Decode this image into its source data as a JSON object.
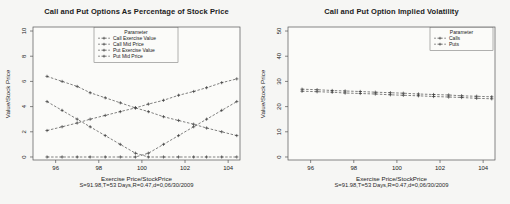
{
  "page": {
    "background": "#f6f6f4",
    "ink_color": "#4a4a4a"
  },
  "chart_data": [
    {
      "type": "line",
      "title": "Call and Put Options As Percentage of Stock Price",
      "xlabel": "Exercise Price/StockPrice",
      "xlabel_sub": "S=91.98,T=53 Days,R=0.47,d=0,06/30/2009",
      "ylabel": "Value/Stock Price",
      "xlim": [
        94.95,
        104.55
      ],
      "ylim": [
        -0.24,
        10.32
      ],
      "xticks": [
        96,
        98,
        100,
        102,
        104
      ],
      "yticks": [
        0,
        2,
        4,
        6,
        8,
        10
      ],
      "grid": false,
      "x": [
        95.6,
        96.3,
        97.0,
        97.6,
        98.3,
        99.0,
        99.7,
        100.3,
        101.0,
        101.7,
        102.4,
        103.0,
        103.7,
        104.4
      ],
      "series": [
        {
          "name": "Call Exercise Value",
          "values": [
            4.4,
            3.7,
            3.0,
            2.4,
            1.7,
            1.0,
            0.3,
            0,
            0,
            0,
            0,
            0,
            0,
            0
          ]
        },
        {
          "name": "Call Mid Price",
          "values": [
            6.4,
            6.0,
            5.6,
            5.1,
            4.7,
            4.3,
            3.9,
            3.6,
            3.2,
            2.9,
            2.6,
            2.3,
            2.0,
            1.7
          ]
        },
        {
          "name": "Put Exercise Value",
          "values": [
            0,
            0,
            0,
            0,
            0,
            0,
            0,
            0.3,
            1.0,
            1.7,
            2.4,
            3.0,
            3.7,
            4.4
          ]
        },
        {
          "name": "Put Mid Price",
          "values": [
            2.1,
            2.4,
            2.7,
            3.0,
            3.3,
            3.6,
            3.9,
            4.2,
            4.5,
            4.9,
            5.2,
            5.5,
            5.9,
            6.2
          ]
        }
      ],
      "legend": {
        "title": "Parameter",
        "position": "top-center",
        "entries": [
          "Call Exercise Value",
          "Call Mid Price",
          "Put Exercise Value",
          "Put Mid Price"
        ],
        "x": 94,
        "y": 27.5,
        "w": 84
      },
      "box": {
        "l": 33,
        "t": 27,
        "r": 240,
        "b": 160
      }
    },
    {
      "type": "line",
      "title": "Call and Put Option Implied Volatility",
      "xlabel": "Exercise Price/StockPrice",
      "xlabel_sub": "S=91.98,T=53 Days,R=0.47,d=0,06/30/2009",
      "ylabel": "Value/Stock Price",
      "xlim": [
        94.95,
        104.55
      ],
      "ylim": [
        -1.2,
        51.6
      ],
      "xticks": [
        96,
        98,
        100,
        102,
        104
      ],
      "yticks": [
        0,
        10,
        20,
        30,
        40,
        50
      ],
      "grid": false,
      "x": [
        95.6,
        96.3,
        97.0,
        97.6,
        98.3,
        99.0,
        99.7,
        100.3,
        101.0,
        101.7,
        102.4,
        103.0,
        103.7,
        104.4
      ],
      "series": [
        {
          "name": "Calls",
          "values": [
            26.9,
            26.7,
            26.4,
            26.2,
            26.0,
            25.7,
            25.5,
            25.3,
            25.0,
            24.8,
            24.6,
            24.3,
            24.1,
            23.9
          ]
        },
        {
          "name": "Puts",
          "values": [
            26.1,
            25.9,
            25.7,
            25.4,
            25.2,
            25.0,
            24.7,
            24.5,
            24.3,
            24.0,
            23.8,
            23.6,
            23.3,
            23.1
          ]
        }
      ],
      "legend": {
        "title": "Parameter",
        "position": "top-right",
        "entries": [
          "Calls",
          "Puts"
        ],
        "x": 175,
        "y": 27.5,
        "w": 63
      },
      "box": {
        "l": 33,
        "t": 27,
        "r": 240,
        "b": 160
      }
    }
  ]
}
